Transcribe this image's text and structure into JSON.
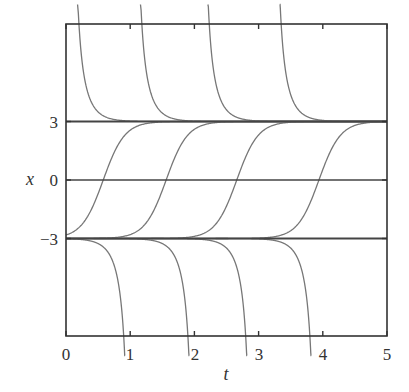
{
  "chart_data": {
    "type": "line",
    "title": "",
    "xlabel": "t",
    "ylabel": "x",
    "xlim": [
      0,
      5
    ],
    "ylim": [
      -8,
      8
    ],
    "xticks": [
      0,
      1,
      2,
      3,
      4,
      5
    ],
    "xtick_labels": [
      "0",
      "1",
      "2",
      "3",
      "4",
      "5"
    ],
    "yticks": [
      3,
      0,
      -3
    ],
    "ytick_labels": [
      "3",
      "0",
      "−3"
    ],
    "grid": false,
    "legend": null,
    "horizontal_lines": [
      3,
      0,
      -3
    ],
    "series": [
      {
        "name": "above-3",
        "kind": "3coth(3(t-t0))",
        "t0": [
          0.07,
          1.05,
          2.1,
          3.22
        ]
      },
      {
        "name": "between",
        "kind": "3tanh(3(t-t0))",
        "t0": [
          0.58,
          1.56,
          2.66,
          3.94
        ]
      },
      {
        "name": "below-3",
        "kind": "3coth(3(t-t0))",
        "t0": [
          1.03,
          2.03,
          2.93,
          3.93
        ]
      }
    ]
  },
  "labels": {
    "xlabel": "t",
    "ylabel": "x",
    "xticks": [
      "0",
      "1",
      "2",
      "3",
      "4",
      "5"
    ],
    "yticks": [
      "3",
      "0",
      "−3"
    ]
  },
  "colors": {
    "axis": "#333333",
    "equilibrium": "#444444",
    "curve": "#777777"
  }
}
